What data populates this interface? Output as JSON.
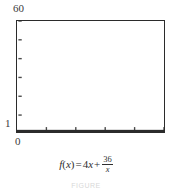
{
  "figure": {
    "caption_strip": "FIGURE"
  },
  "axis_labels": {
    "y_max": "60",
    "y_min": "1",
    "x_min": "0"
  },
  "equation": {
    "lhs_f": "f",
    "lhs_open": "(",
    "lhs_var": "x",
    "lhs_close": ")",
    "equals": "=",
    "term1_coeff": "4",
    "term1_var": "x",
    "plus": "+",
    "frac_numerator": "36",
    "frac_denominator": "x",
    "plain": "f(x) = 4x + 36/x"
  },
  "chart_data": {
    "type": "line",
    "title": "",
    "subtitle": "",
    "xlabel": "",
    "ylabel": "",
    "function": "f(x) = 4x + 36/x",
    "xlim": [
      0,
      20
    ],
    "ylim": [
      1,
      60
    ],
    "grid": false,
    "legend": false,
    "frame": true,
    "x_tick_count": 5,
    "y_tick_count": 6,
    "x_ticks": [
      4,
      8,
      12,
      16,
      20
    ],
    "y_ticks": [
      10,
      20,
      30,
      40,
      50,
      60
    ],
    "minimum_point": {
      "x": 3,
      "y": 24
    },
    "x": [
      1.0,
      1.4,
      1.8,
      2.2,
      2.6,
      3.0,
      3.4,
      3.8,
      4.2,
      4.6,
      5.0,
      5.6,
      6.2,
      7.0,
      7.8,
      8.6,
      9.4,
      10.4,
      11.4,
      12.4,
      13.4,
      14.6,
      15.8,
      17.0,
      18.2,
      19.4,
      20.0
    ],
    "y": [
      40.0,
      31.3,
      27.2,
      25.2,
      24.2,
      24.0,
      24.2,
      24.7,
      25.4,
      26.2,
      27.2,
      28.8,
      30.6,
      33.1,
      35.8,
      38.6,
      41.4,
      45.1,
      48.8,
      52.5,
      56.3,
      60.9,
      65.5,
      70.1,
      74.8,
      79.5,
      81.8
    ],
    "note": "Curve is clipped by the window; only the portion between y=1 and y=60 is drawn. The drawn trace descends steeply from the left edge to a flat minimum near x=3 then rises in small steps to the right edge."
  },
  "colors": {
    "frame": "#2b2b2b",
    "curve": "#1a1a1a",
    "tick": "#4a4a4a",
    "text": "#2f2f2f",
    "background": "#ffffff"
  }
}
